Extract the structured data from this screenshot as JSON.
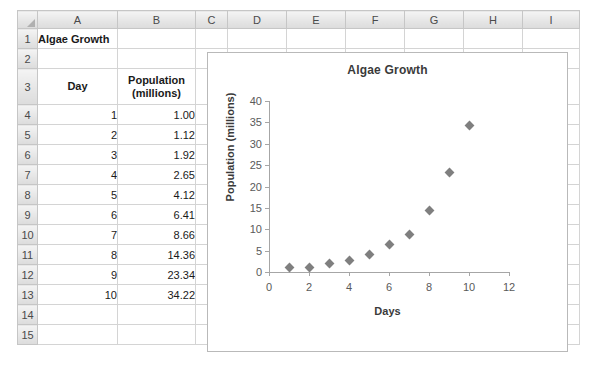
{
  "spreadsheet": {
    "columns": [
      "A",
      "B",
      "C",
      "D",
      "E",
      "F",
      "G",
      "H",
      "I"
    ],
    "rows": [
      "1",
      "2",
      "3",
      "4",
      "5",
      "6",
      "7",
      "8",
      "9",
      "10",
      "11",
      "12",
      "13",
      "14",
      "15"
    ],
    "cells": {
      "A1": "Algae Growth",
      "A3": "Day",
      "B3": "Population (millions)",
      "B3_line1": "Population",
      "B3_line2": "(millions)",
      "A4": "1",
      "B4": "1.00",
      "A5": "2",
      "B5": "1.12",
      "A6": "3",
      "B6": "1.92",
      "A7": "4",
      "B7": "2.65",
      "A8": "5",
      "B8": "4.12",
      "A9": "6",
      "B9": "6.41",
      "A10": "7",
      "B10": "8.66",
      "A11": "8",
      "B11": "14.36",
      "A12": "9",
      "B12": "23.34",
      "A13": "10",
      "B13": "34.22"
    }
  },
  "chart_data": {
    "type": "scatter",
    "title": "Algae Growth",
    "xlabel": "Days",
    "ylabel": "Population (millions)",
    "xlim": [
      0,
      12
    ],
    "ylim": [
      0,
      40
    ],
    "xticks": [
      0,
      2,
      4,
      6,
      8,
      10,
      12
    ],
    "yticks": [
      0,
      5,
      10,
      15,
      20,
      25,
      30,
      35,
      40
    ],
    "grid": false,
    "legend": "none",
    "marker": "diamond",
    "marker_color": "#7f7f7f",
    "x": [
      1,
      2,
      3,
      4,
      5,
      6,
      7,
      8,
      9,
      10
    ],
    "y": [
      1.0,
      1.12,
      1.92,
      2.65,
      4.12,
      6.41,
      8.66,
      14.36,
      23.34,
      34.22
    ],
    "series": [
      {
        "name": "Population (millions)",
        "values": [
          1.0,
          1.12,
          1.92,
          2.65,
          4.12,
          6.41,
          8.66,
          14.36,
          23.34,
          34.22
        ]
      }
    ]
  }
}
